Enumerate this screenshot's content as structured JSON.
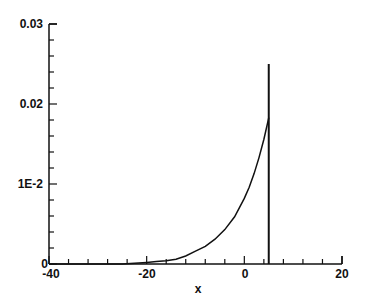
{
  "chart_data": {
    "type": "line",
    "title": "",
    "xlabel": "x",
    "ylabel": "",
    "xlim": [
      -40,
      20
    ],
    "ylim": [
      0,
      0.03
    ],
    "grid": false,
    "legend": null,
    "x_ticks": [
      {
        "value": -40,
        "label": "-40"
      },
      {
        "value": -20,
        "label": "-20"
      },
      {
        "value": 0,
        "label": "0"
      },
      {
        "value": 20,
        "label": "20"
      }
    ],
    "x_minor_step": 4,
    "y_ticks": [
      {
        "value": 0,
        "label": "0"
      },
      {
        "value": 0.01,
        "label": "1E-2"
      },
      {
        "value": 0.02,
        "label": "0.02"
      },
      {
        "value": 0.03,
        "label": "0.03"
      }
    ],
    "y_minor_step": 0.002,
    "series": [
      {
        "name": "curve",
        "color": "#111111",
        "x": [
          -40,
          -30,
          -25,
          -20,
          -18,
          -16,
          -14,
          -12,
          -10,
          -8,
          -6,
          -4,
          -2,
          0,
          1,
          2,
          3,
          4,
          5
        ],
        "y": [
          0.0,
          0.0,
          0.0,
          0.0002,
          0.0003,
          0.0004,
          0.0006,
          0.001,
          0.0016,
          0.0022,
          0.0031,
          0.0043,
          0.0059,
          0.0082,
          0.0096,
          0.0113,
          0.0133,
          0.0156,
          0.0183
        ]
      },
      {
        "name": "vertical-line",
        "color": "#111111",
        "x": [
          5,
          5
        ],
        "y": [
          0,
          0.025
        ]
      }
    ]
  },
  "labels": {
    "xlabel": "x",
    "x_tick_m40": "-40",
    "x_tick_m20": "-20",
    "x_tick_0": "0",
    "x_tick_20": "20",
    "y_tick_0": "0",
    "y_tick_1e2": "1E-2",
    "y_tick_002": "0.02",
    "y_tick_003": "0.03"
  }
}
